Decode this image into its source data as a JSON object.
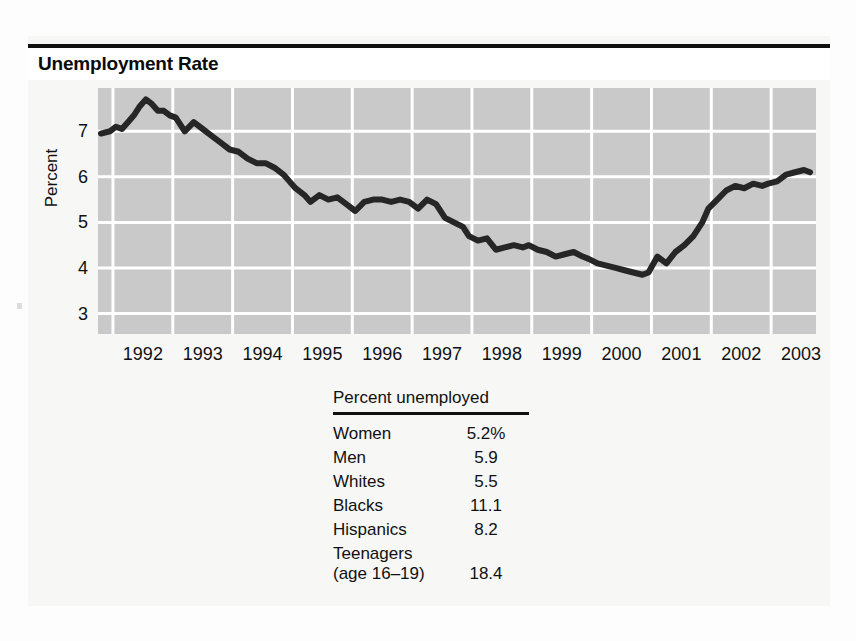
{
  "figure": {
    "title": "Unemployment Rate"
  },
  "chart_data": {
    "type": "line",
    "title": "Unemployment Rate",
    "xlabel": "",
    "ylabel": "Percent",
    "xlim": [
      1991.75,
      2003.75
    ],
    "ylim": [
      2.55,
      7.95
    ],
    "grid": true,
    "legend": "none",
    "x_ticks": [
      "1992",
      "1993",
      "1994",
      "1995",
      "1996",
      "1997",
      "1998",
      "1999",
      "2000",
      "2001",
      "2002",
      "2003"
    ],
    "y_ticks": [
      "3",
      "4",
      "5",
      "6",
      "7"
    ],
    "series": [
      {
        "name": "Unemployment rate",
        "color": "#262626",
        "x": [
          1991.8,
          1991.95,
          1992.05,
          1992.15,
          1992.25,
          1992.35,
          1992.45,
          1992.55,
          1992.65,
          1992.75,
          1992.85,
          1992.95,
          1993.05,
          1993.2,
          1993.35,
          1993.5,
          1993.65,
          1993.8,
          1993.95,
          1994.1,
          1994.25,
          1994.4,
          1994.55,
          1994.7,
          1994.85,
          1994.95,
          1995.05,
          1995.2,
          1995.3,
          1995.45,
          1995.6,
          1995.75,
          1995.9,
          1996.05,
          1996.2,
          1996.35,
          1996.5,
          1996.65,
          1996.8,
          1996.95,
          1997.1,
          1997.25,
          1997.4,
          1997.55,
          1997.7,
          1997.85,
          1997.95,
          1998.1,
          1998.25,
          1998.4,
          1998.55,
          1998.7,
          1998.85,
          1998.95,
          1999.1,
          1999.25,
          1999.4,
          1999.55,
          1999.7,
          1999.85,
          1999.95,
          2000.1,
          2000.25,
          2000.4,
          2000.55,
          2000.7,
          2000.85,
          2000.95,
          2001.1,
          2001.25,
          2001.4,
          2001.55,
          2001.7,
          2001.85,
          2001.95,
          2002.1,
          2002.25,
          2002.4,
          2002.55,
          2002.7,
          2002.85,
          2002.95,
          2003.1,
          2003.25,
          2003.4,
          2003.55,
          2003.65
        ],
        "y": [
          6.95,
          7.0,
          7.1,
          7.05,
          7.2,
          7.35,
          7.55,
          7.7,
          7.6,
          7.45,
          7.45,
          7.35,
          7.3,
          7.0,
          7.2,
          7.05,
          6.9,
          6.75,
          6.6,
          6.55,
          6.4,
          6.3,
          6.3,
          6.2,
          6.05,
          5.9,
          5.75,
          5.6,
          5.45,
          5.6,
          5.5,
          5.55,
          5.4,
          5.25,
          5.45,
          5.5,
          5.5,
          5.45,
          5.5,
          5.45,
          5.3,
          5.5,
          5.4,
          5.1,
          5.0,
          4.9,
          4.7,
          4.6,
          4.65,
          4.4,
          4.45,
          4.5,
          4.45,
          4.5,
          4.4,
          4.35,
          4.25,
          4.3,
          4.35,
          4.25,
          4.2,
          4.1,
          4.05,
          4.0,
          3.95,
          3.9,
          3.85,
          3.9,
          4.25,
          4.1,
          4.35,
          4.5,
          4.7,
          5.0,
          5.3,
          5.5,
          5.7,
          5.8,
          5.75,
          5.85,
          5.8,
          5.85,
          5.9,
          6.05,
          6.1,
          6.15,
          6.1
        ]
      }
    ],
    "notable_points": {
      "peak": {
        "x": 1992.55,
        "y": 7.7,
        "label": "1992 peak"
      },
      "trough": {
        "x": 2000.85,
        "y": 3.85,
        "label": "2000 trough"
      },
      "end": {
        "x": 2003.65,
        "y": 6.1,
        "label": "2003 latest"
      }
    }
  },
  "stat_table": {
    "header": "Percent unemployed",
    "rows": [
      {
        "label": "Women",
        "value": "5.2%"
      },
      {
        "label": "Men",
        "value": "5.9"
      },
      {
        "label": "Whites",
        "value": "5.5"
      },
      {
        "label": "Blacks",
        "value": "11.1"
      },
      {
        "label": "Hispanics",
        "value": "8.2"
      }
    ],
    "last_row": {
      "label_line1": "Teenagers",
      "label_line2": "(age 16–19)",
      "value": "18.4"
    }
  },
  "colors": {
    "line": "#262626",
    "panel": "#c9c9c9",
    "gridline": "#ffffff",
    "paper": "#f7f7f6",
    "ink": "#111111"
  }
}
